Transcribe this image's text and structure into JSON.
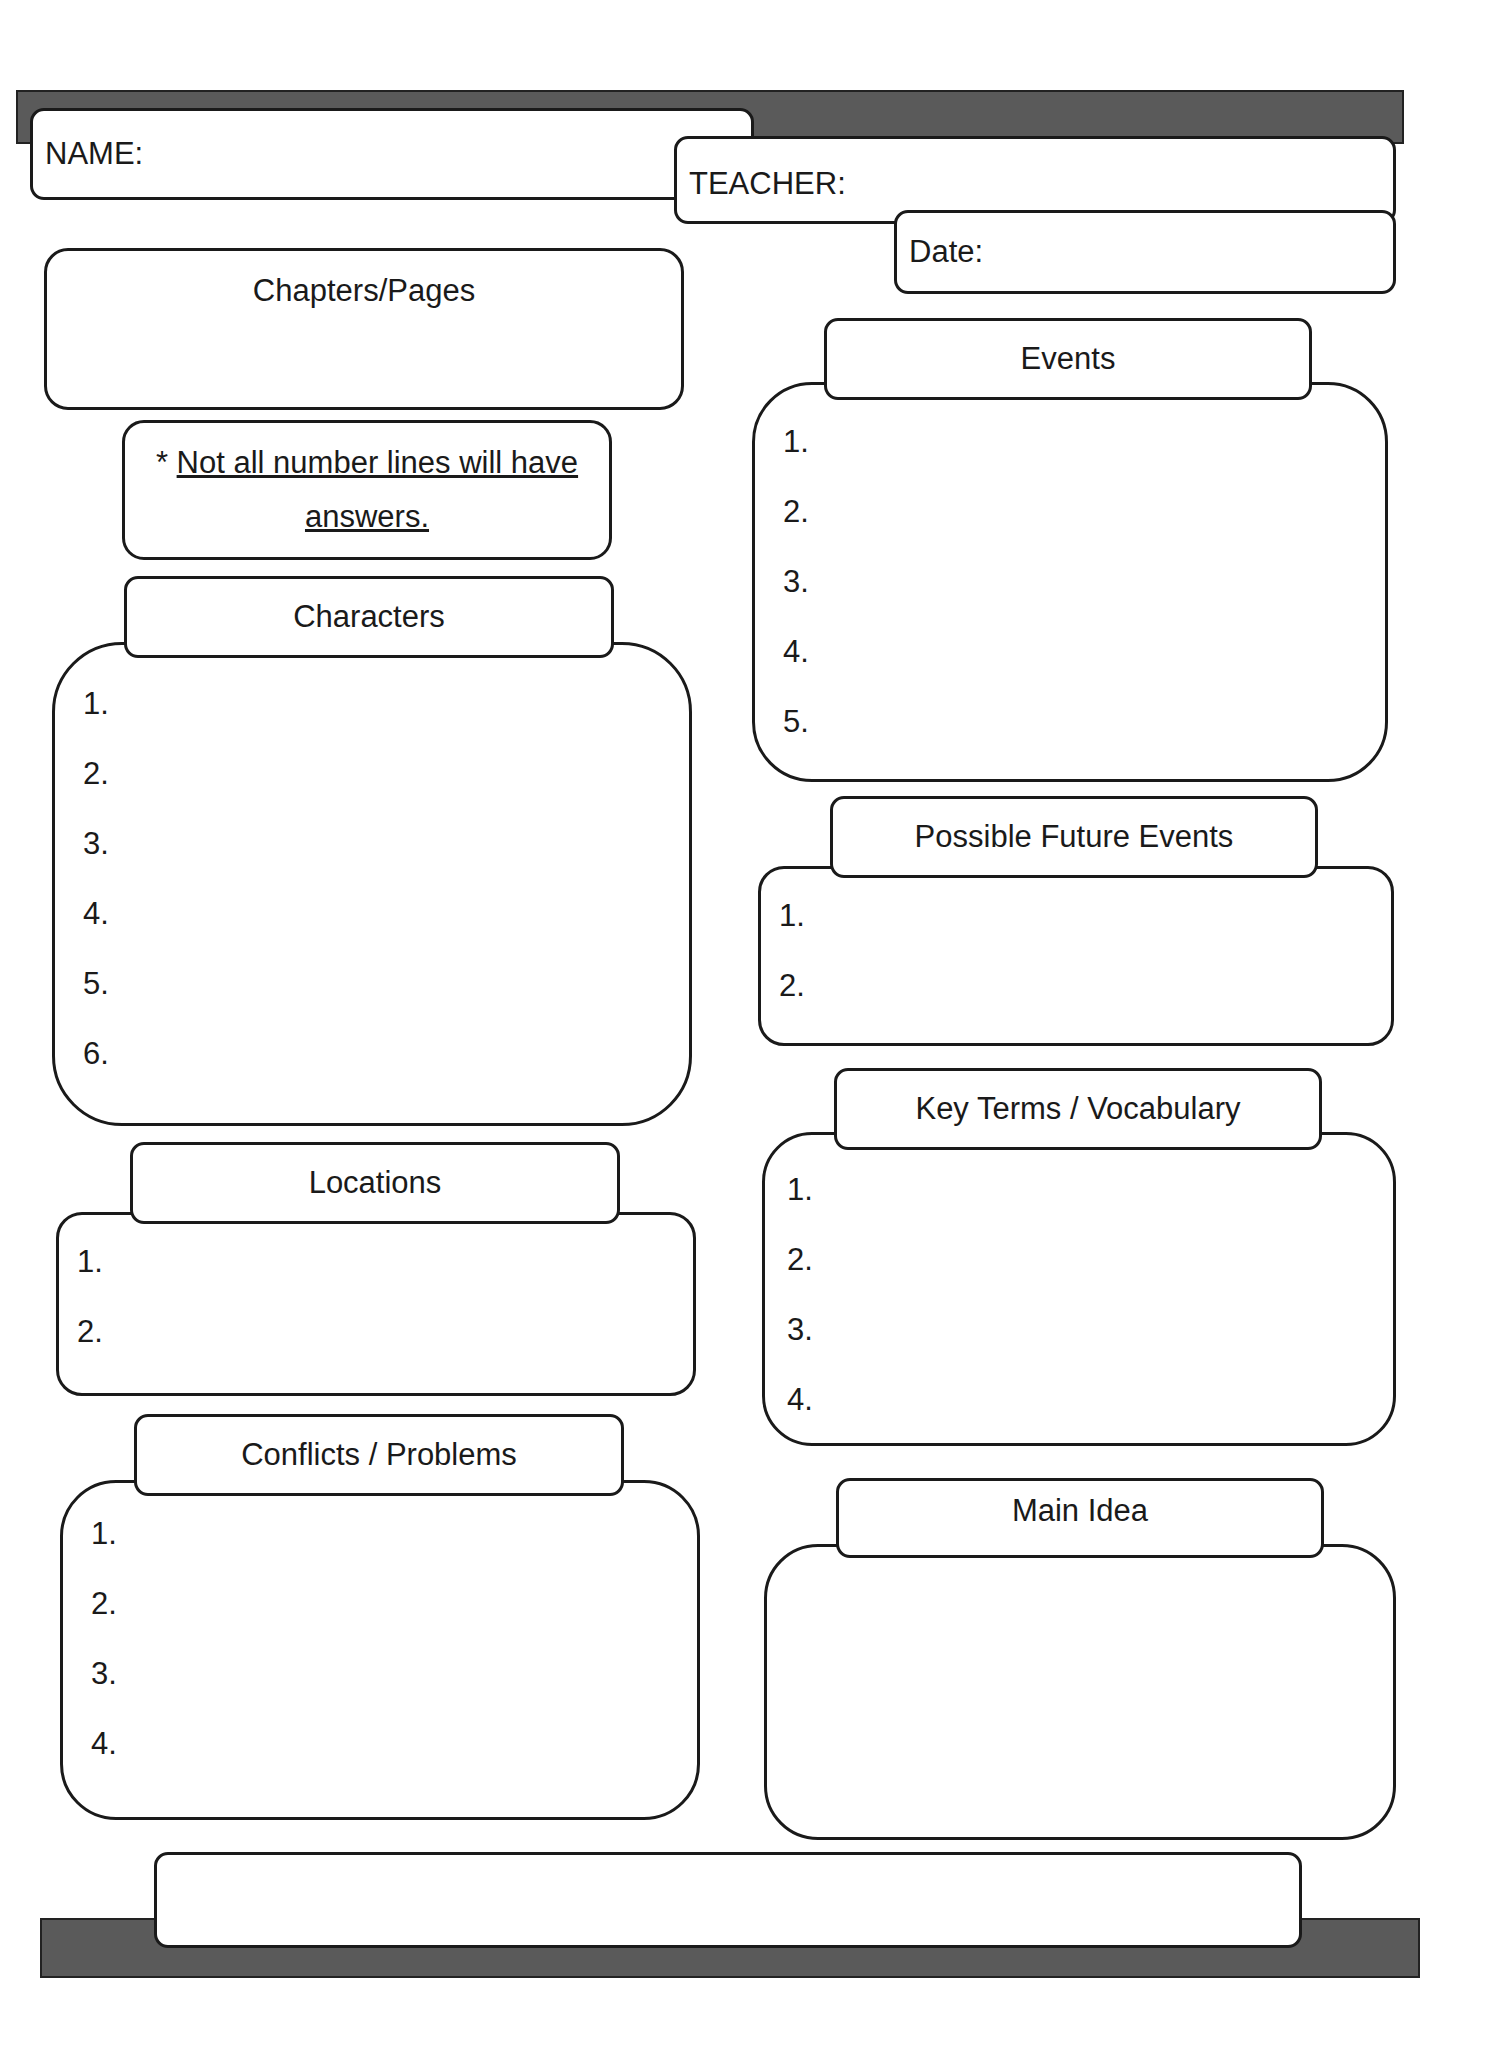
{
  "header": {
    "name_label": "NAME:",
    "teacher_label": "TEACHER:",
    "date_label": "Date:"
  },
  "chapters": {
    "label": "Chapters/Pages"
  },
  "note": {
    "star": "*",
    "line1": "Not all number lines will have",
    "line2": "answers."
  },
  "characters": {
    "title": "Characters",
    "items": [
      "1.",
      "2.",
      "3.",
      "4.",
      "5.",
      "6."
    ]
  },
  "locations": {
    "title": "Locations",
    "items": [
      "1.",
      "2."
    ]
  },
  "conflicts": {
    "title": "Conflicts / Problems",
    "items": [
      "1.",
      "2.",
      "3.",
      "4."
    ]
  },
  "events": {
    "title": "Events",
    "items": [
      "1.",
      "2.",
      "3.",
      "4.",
      "5."
    ]
  },
  "future_events": {
    "title": "Possible Future Events",
    "items": [
      "1.",
      "2."
    ]
  },
  "vocabulary": {
    "title": "Key Terms / Vocabulary",
    "items": [
      "1.",
      "2.",
      "3.",
      "4."
    ]
  },
  "main_idea": {
    "title": "Main Idea"
  }
}
